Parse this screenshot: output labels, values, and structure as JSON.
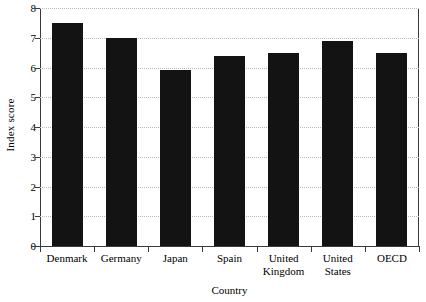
{
  "chart_data": {
    "type": "bar",
    "title": "",
    "xlabel": "Country",
    "ylabel": "Index score",
    "categories": [
      "Denmark",
      "Germany",
      "Japan",
      "Spain",
      "United Kingdom",
      "United States",
      "OECD"
    ],
    "values": [
      7.5,
      7.0,
      5.9,
      6.4,
      6.5,
      6.9,
      6.5
    ],
    "ylim": [
      0,
      8
    ],
    "yticks": [
      0,
      1,
      2,
      3,
      4,
      5,
      6,
      7,
      8
    ],
    "ytick_labels": [
      "0",
      "1",
      "2",
      "3",
      "4",
      "5",
      "6",
      "7",
      "8"
    ],
    "grid": "horizontal-dotted",
    "legend": "none",
    "bar_color": "#131313",
    "grid_color": "#b9b9b9",
    "axis_color": "#3a3a3a",
    "background": "#ffffff"
  }
}
